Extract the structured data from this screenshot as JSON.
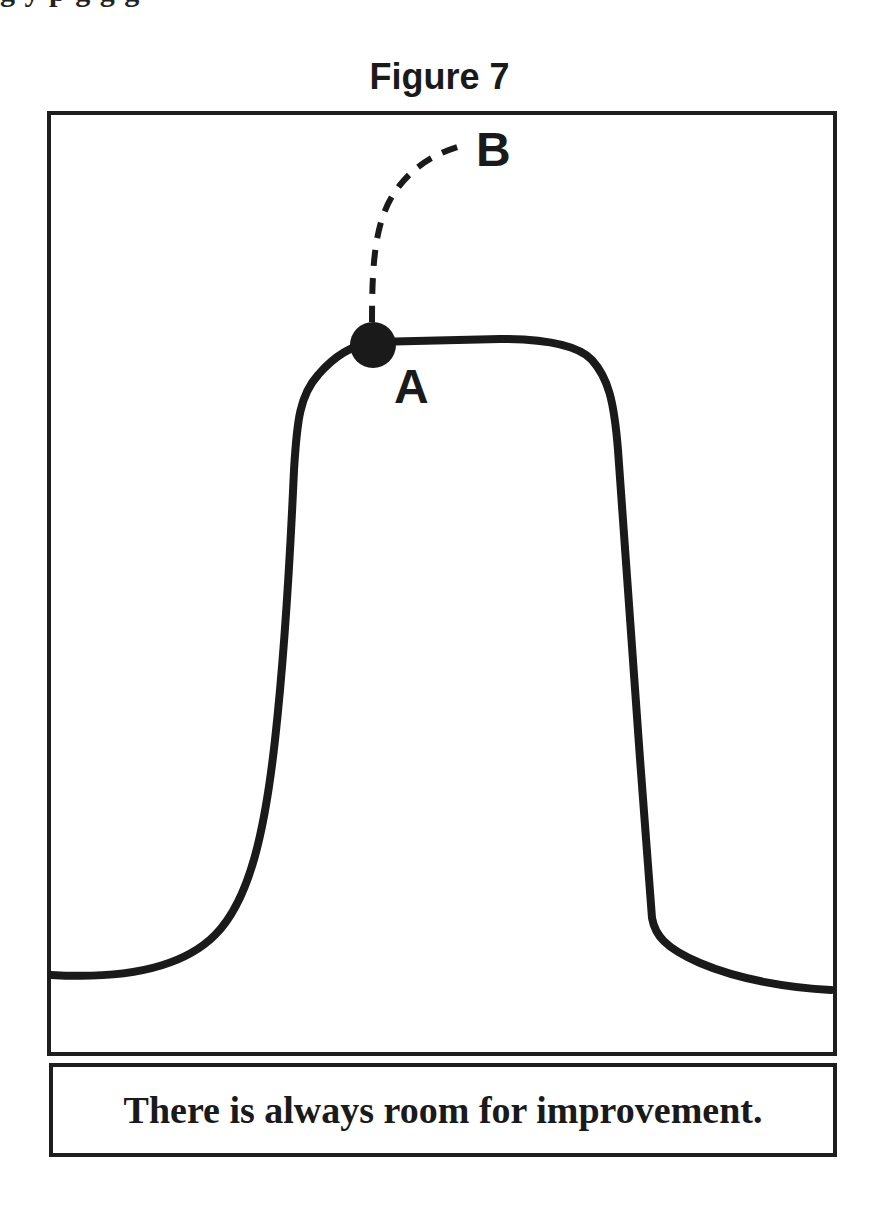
{
  "header": {
    "clipped_line": "g         y p            g          g          g"
  },
  "figure": {
    "title": "Figure 7",
    "points": {
      "a_label": "A",
      "b_label": "B"
    },
    "colors": {
      "line": "#1a1a1a",
      "background": "#ffffff"
    }
  },
  "caption": {
    "text": "There is always room for improvement."
  }
}
